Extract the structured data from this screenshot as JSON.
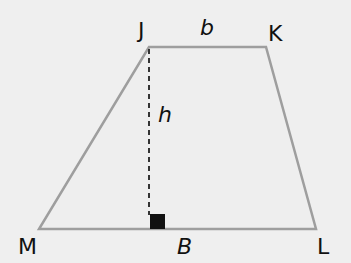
{
  "diagram": {
    "type": "trapezoid",
    "background_color": "#efefef",
    "fill_color": "#eeeeee",
    "stroke_color": "#9e9e9e",
    "height_line_color": "#333333",
    "right_angle_marker_color": "#111111",
    "vertices": [
      {
        "label": "J",
        "x": 149,
        "y": 47
      },
      {
        "label": "K",
        "x": 266,
        "y": 47
      },
      {
        "label": "L",
        "x": 316,
        "y": 229
      },
      {
        "label": "M",
        "x": 39,
        "y": 229
      }
    ],
    "labels": {
      "top_base": "b",
      "bottom_base": "B",
      "height": "h"
    }
  }
}
